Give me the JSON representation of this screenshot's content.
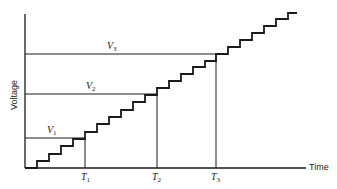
{
  "diagram": {
    "type": "staircase-voltage-vs-time",
    "axes": {
      "xlabel": "Time",
      "ylabel": "Voltage"
    },
    "voltage_levels": [
      {
        "symbol": "V",
        "sub": "1"
      },
      {
        "symbol": "V",
        "sub": "2"
      },
      {
        "symbol": "V",
        "sub": "3"
      }
    ],
    "time_marks": [
      {
        "symbol": "T",
        "sub": "1"
      },
      {
        "symbol": "T",
        "sub": "2"
      },
      {
        "symbol": "T",
        "sub": "3"
      }
    ],
    "colors": {
      "line": "#1a1a1a",
      "background": "#ffffff"
    }
  }
}
